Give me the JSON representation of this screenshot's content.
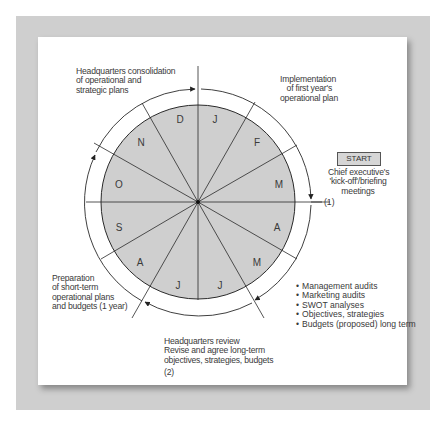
{
  "diagram": {
    "months": [
      "J",
      "F",
      "M",
      "A",
      "M",
      "J",
      "J",
      "A",
      "S",
      "O",
      "N",
      "D"
    ],
    "center_marker": "(1)",
    "start_button": "START",
    "annotations": {
      "hq_consolidation": [
        "Headquarters consolidation",
        "of operational and",
        "strategic plans"
      ],
      "implementation": [
        "Implementation",
        "of first year's",
        "operational plan"
      ],
      "start_caption": [
        "Chief executive's",
        "'kick-off'/briefing",
        "meetings"
      ],
      "preparation": [
        "Preparation",
        "of short-term",
        "operational plans",
        "and budgets (1 year)"
      ],
      "hq_review": [
        "Headquarters review",
        "Revise and agree long-term",
        "objectives, strategies, budgets"
      ],
      "hq_review_marker": "(2)",
      "activities": [
        "Management audits",
        "Marketing audits",
        "SWOT analyses",
        "Objectives, strategies",
        "Budgets (proposed) long term"
      ]
    },
    "colors": {
      "disc_fill": "#cfcfcf",
      "line": "#2a2a2a",
      "backing": "#cfcfcf"
    }
  }
}
